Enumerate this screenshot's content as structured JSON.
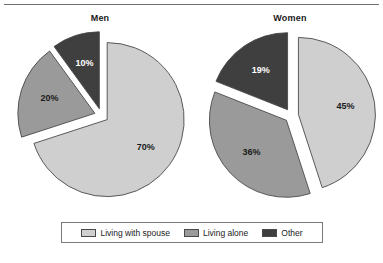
{
  "chart_data": {
    "type": "pie",
    "title": "",
    "legend_position": "bottom",
    "value_suffix": "%",
    "panels": [
      {
        "title": "Men",
        "slices": [
          {
            "label": "Living with spouse",
            "value": 70,
            "display": "70%",
            "color": "#cfcfcf",
            "exploded": true
          },
          {
            "label": "Living alone",
            "value": 20,
            "display": "20%",
            "color": "#9a9a9a",
            "exploded": true
          },
          {
            "label": "Other",
            "value": 10,
            "display": "10%",
            "color": "#3f3f3f",
            "exploded": true
          }
        ]
      },
      {
        "title": "Women",
        "slices": [
          {
            "label": "Living with spouse",
            "value": 45,
            "display": "45%",
            "color": "#cfcfcf",
            "exploded": true
          },
          {
            "label": "Living alone",
            "value": 36,
            "display": "36%",
            "color": "#9a9a9a",
            "exploded": true
          },
          {
            "label": "Other",
            "value": 19,
            "display": "19%",
            "color": "#3f3f3f",
            "exploded": true
          }
        ]
      }
    ],
    "legend": [
      {
        "label": "Living with spouse",
        "color": "#cfcfcf"
      },
      {
        "label": "Living alone",
        "color": "#9a9a9a"
      },
      {
        "label": "Other",
        "color": "#3f3f3f"
      }
    ]
  },
  "figure": {
    "geometry": {
      "radius": 77,
      "explode_offset": 7,
      "start_angle_deg": -90,
      "label_radius_factor": 0.62
    },
    "colors": {
      "slice_outline": "#4a4a4a",
      "background": "#ffffff",
      "rule": "#6f6f6f"
    }
  }
}
